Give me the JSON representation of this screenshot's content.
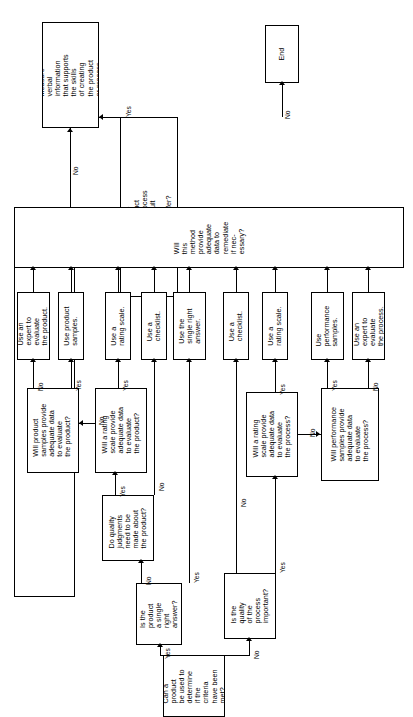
{
  "diagram": {
    "orientation": "rotated-90-ccw",
    "colors": {
      "stroke": "#000000",
      "fill": "#ffffff",
      "text": "#000000"
    },
    "nodes": [
      {
        "id": "measure-verbal",
        "type": "process",
        "text": "Measure\nverbal\ninformation\nthat supports\nthe skills\nof creating\nthe product\nor process."
      },
      {
        "id": "end",
        "type": "terminator",
        "text": "End"
      },
      {
        "id": "far-transfer",
        "type": "decision",
        "text": "Is the\nproduct\nor process\na result\nof far\ntransfer?"
      },
      {
        "id": "remediate",
        "type": "decision",
        "text": "Will\nthis\nmethod\nprovide\nadequate\ndata to\nremediate\nif nec-\nessary?"
      },
      {
        "id": "use-expert-product",
        "type": "process",
        "text": "Use an\nexpert to\nevaluate\nthe product."
      },
      {
        "id": "use-product-samples",
        "type": "process",
        "text": "Use product\nsamples."
      },
      {
        "id": "use-rating-scale-product",
        "type": "process",
        "text": "Use a\nrating scale."
      },
      {
        "id": "use-checklist-product",
        "type": "process",
        "text": "Use a\nchecklist."
      },
      {
        "id": "use-single-right-answer",
        "type": "process",
        "text": "Use the\nsingle right\nanswer."
      },
      {
        "id": "use-checklist-process",
        "type": "process",
        "text": "Use a\nchecklist."
      },
      {
        "id": "use-rating-scale-process",
        "type": "process",
        "text": "Use a\nrating scale."
      },
      {
        "id": "use-performance-samples",
        "type": "process",
        "text": "Use\nperformance\nsamples."
      },
      {
        "id": "use-expert-process",
        "type": "process",
        "text": "Use an\nexpert to\nevaluate\nthe process."
      },
      {
        "id": "product-samples-adequate",
        "type": "decision",
        "text": "Will product\nsamples provide\nadequate data\nto evaluate\nthe product?"
      },
      {
        "id": "rating-scale-adequate-product",
        "type": "decision",
        "text": "Will a rating\nscale provide\nadequate data\nto evaluate\nthe product?"
      },
      {
        "id": "rating-scale-adequate-process",
        "type": "decision",
        "text": "Will a rating\nscale provide\nadequate data\nto evaluate\nthe process?"
      },
      {
        "id": "performance-samples-adequate",
        "type": "decision",
        "text": "Will performance\nsamples provide\nadequate data\nto evaluate\nthe process?"
      },
      {
        "id": "quality-judgments",
        "type": "decision",
        "text": "Do quality\njudgments\nneed to be\nmade about\nthe product?"
      },
      {
        "id": "single-right-answer",
        "type": "decision",
        "text": "Is the\nproduct\na single\nright\nanswer?"
      },
      {
        "id": "quality-of-process",
        "type": "decision",
        "text": "Is the\nquality\nof the\nprocess\nimportant?"
      },
      {
        "id": "start-can-product",
        "type": "decision",
        "text": "Can a\nproduct\nbe used to\ndetermine\nif the\ncriteria\nhave been\nmet?"
      }
    ],
    "edge_labels": {
      "far_transfer_yes": "Yes",
      "far_transfer_no": "No",
      "remediate_yes": "Yes",
      "remediate_no": "No",
      "product_samples_no": "No",
      "product_samples_yes": "Yes",
      "rating_scale_product_no": "No",
      "rating_scale_product_yes": "Yes",
      "quality_judgments_yes": "Yes",
      "quality_judgments_no_left": "No",
      "quality_judgments_no_down": "No",
      "single_right_no": "No",
      "single_right_yes": "Yes",
      "start_yes": "Yes",
      "start_no": "No",
      "quality_process_no": "No",
      "quality_process_yes": "Yes",
      "rating_scale_process_yes": "Yes",
      "rating_scale_process_no": "No",
      "performance_samples_yes": "Yes",
      "performance_samples_no": "No"
    }
  }
}
